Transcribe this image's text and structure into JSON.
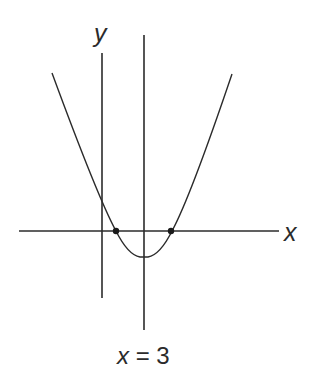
{
  "figure": {
    "type": "graph-of-parabola",
    "axes": {
      "x_label": "x",
      "y_label": "y"
    },
    "axis_of_symmetry": {
      "equation": "x = 3",
      "label_parts": {
        "var": "x",
        "eq": " = ",
        "val": "3"
      }
    },
    "marked_points": [
      {
        "name": "left-root",
        "on": "x-axis"
      },
      {
        "name": "right-root",
        "on": "x-axis"
      }
    ],
    "colors": {
      "line": "#2b2b2b",
      "background": "#ffffff"
    }
  }
}
